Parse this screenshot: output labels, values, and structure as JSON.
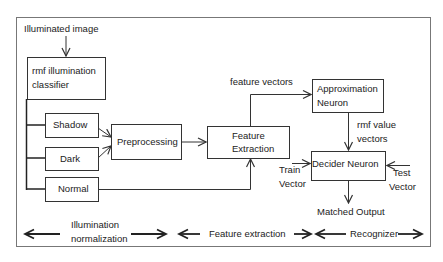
{
  "diagram": {
    "input_label": "Illuminated image",
    "nodes": {
      "classifier": "rmf illumination classifier",
      "classifier_line1": "rmf illumination",
      "classifier_line2": "classifier",
      "shadow": "Shadow",
      "dark": "Dark",
      "normal": "Normal",
      "preprocessing": "Preprocessing",
      "feature_extraction_line1": "Feature",
      "feature_extraction_line2": "Extraction",
      "approximation_line1": "Approximation",
      "approximation_line2": "Neuron",
      "decider": "Decider Neuron"
    },
    "edge_labels": {
      "feature_vectors": "feature vectors",
      "rmf_value_line1": "rmf value",
      "rmf_value_line2": "vectors",
      "train_line1": "Train",
      "train_line2": "Vector",
      "test_line1": "Test",
      "test_line2": "Vector",
      "output": "Matched Output"
    },
    "stages": [
      {
        "line1": "Illumination",
        "line2": "normalization"
      },
      {
        "line1": "Feature extraction"
      },
      {
        "line1": "Recognizer"
      }
    ],
    "colors": {
      "stroke": "#333333",
      "frame": "#777777",
      "text": "#222222"
    }
  }
}
